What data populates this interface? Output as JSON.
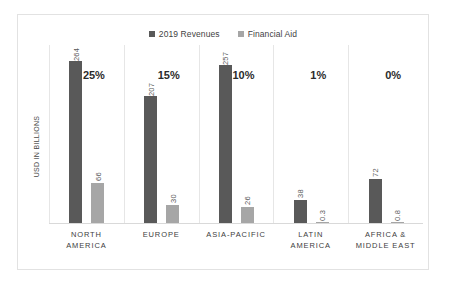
{
  "chart_data": {
    "type": "bar",
    "title": "",
    "xlabel": "",
    "ylabel": "USD IN BILLIONS",
    "grid": false,
    "legend_position": "top-center",
    "ylim": [
      0,
      290
    ],
    "categories": [
      "NORTH AMERICA",
      "EUROPE",
      "ASIA-PACIFIC",
      "LATIN AMERICA",
      "AFRICA & MIDDLE EAST"
    ],
    "category_lines": [
      [
        "NORTH",
        "AMERICA"
      ],
      [
        "EUROPE"
      ],
      [
        "ASIA-PACIFIC"
      ],
      [
        "LATIN",
        "AMERICA"
      ],
      [
        "AFRICA &",
        "MIDDLE EAST"
      ]
    ],
    "series": [
      {
        "name": "2019 Revenues",
        "color": "#595959",
        "values": [
          264,
          207,
          257,
          38,
          72
        ],
        "labels": [
          "264",
          "207",
          "257",
          "38",
          "72"
        ]
      },
      {
        "name": "Financial Aid",
        "color": "#a6a6a6",
        "values": [
          66,
          30,
          26,
          0.3,
          0.8
        ],
        "labels": [
          "66",
          "30",
          "26",
          "0.3",
          "0.8"
        ]
      }
    ],
    "annotations": {
      "name": "percent-share",
      "values": [
        "25%",
        "15%",
        "10%",
        "1%",
        "0%"
      ]
    }
  },
  "legend": {
    "entries": [
      {
        "label": "2019 Revenues",
        "color": "#595959"
      },
      {
        "label": "Financial Aid",
        "color": "#a6a6a6"
      }
    ]
  }
}
